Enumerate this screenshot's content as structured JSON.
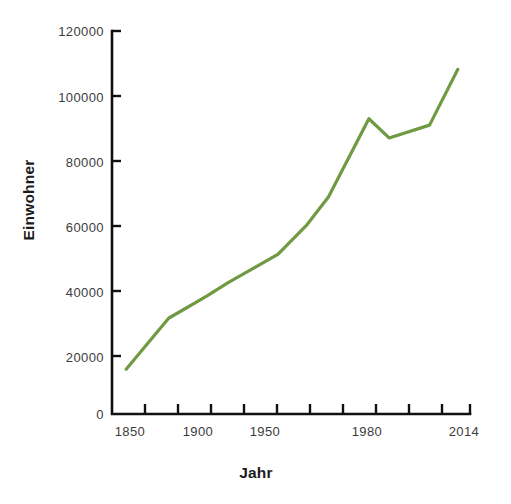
{
  "chart_data": {
    "type": "line",
    "title": "",
    "subtitle": "",
    "xlabel": "Jahr",
    "ylabel": "Einwohner",
    "grid": false,
    "legend": null,
    "line_color": "#6f9a41",
    "axis_color": "#111111",
    "background": "#ffffff",
    "xlim": [
      1843,
      2020
    ],
    "ylim": [
      0,
      120000
    ],
    "ytick_labels": [
      "0",
      "20000",
      "40000",
      "60000",
      "80000",
      "100000",
      "120000"
    ],
    "ytick_values": [
      0,
      20000,
      40000,
      60000,
      80000,
      100000,
      120000
    ],
    "xtick_labels": [
      "1850",
      "1900",
      "1950",
      "1980",
      "2014"
    ],
    "xtick_values": [
      1850,
      1900,
      1950,
      1980,
      2014
    ],
    "x": [
      1850,
      1871,
      1890,
      1900,
      1925,
      1939,
      1950,
      1970,
      1980,
      2000,
      2014
    ],
    "values": [
      14000,
      30000,
      37000,
      41000,
      50000,
      59000,
      68000,
      92500,
      86500,
      90500,
      108000
    ],
    "series": [
      {
        "name": "Einwohner",
        "color": "#6f9a41",
        "values": [
          14000,
          30000,
          37000,
          41000,
          50000,
          59000,
          68000,
          92500,
          86500,
          90500,
          108000
        ]
      }
    ],
    "x_minor_tick_count": 11
  },
  "axis": {
    "y_title": "Einwohner",
    "x_title": "Jahr",
    "y_ticks": [
      {
        "label": "120000",
        "value": 120000
      },
      {
        "label": "100000",
        "value": 100000
      },
      {
        "label": "80000",
        "value": 80000
      },
      {
        "label": "60000",
        "value": 60000
      },
      {
        "label": "40000",
        "value": 40000
      },
      {
        "label": "20000",
        "value": 20000
      },
      {
        "label": "0",
        "value": 0
      }
    ],
    "x_ticks": [
      {
        "label": "1850",
        "value": 1850
      },
      {
        "label": "1900",
        "value": 1900
      },
      {
        "label": "1950",
        "value": 1950
      },
      {
        "label": "1980",
        "value": 1980
      },
      {
        "label": "2014",
        "value": 2014
      }
    ]
  }
}
